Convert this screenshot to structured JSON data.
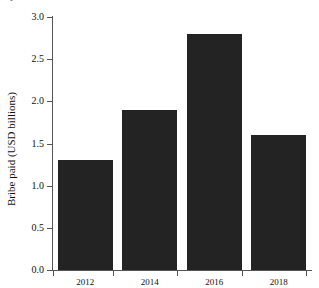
{
  "figure": {
    "caption_fragment": "B                                                  y",
    "background_color": "#ffffff",
    "bar_color": "#232323",
    "axis_color": "#555555",
    "text_color": "#111111"
  },
  "chart_data": {
    "type": "bar",
    "title": "",
    "xlabel": "",
    "ylabel": "Bribe paid (USD billions)",
    "categories": [
      "2012",
      "2014",
      "2016",
      "2018"
    ],
    "values": [
      1.3,
      1.9,
      2.8,
      1.6
    ],
    "ylim": [
      0.0,
      3.0
    ],
    "ytick_labels": [
      "0.0",
      "0.5",
      "1.0",
      "1.5",
      "2.0",
      "2.5",
      "3.0"
    ],
    "ytick_values": [
      0.0,
      0.5,
      1.0,
      1.5,
      2.0,
      2.5,
      3.0
    ],
    "xtick_labels": [
      "2012",
      "2014",
      "2016",
      "2018"
    ],
    "grid": false,
    "legend": false,
    "legend_position": "none",
    "series": [
      {
        "name": "Bribe paid (USD billions)",
        "values": [
          1.3,
          1.9,
          2.8,
          1.6
        ]
      }
    ]
  }
}
